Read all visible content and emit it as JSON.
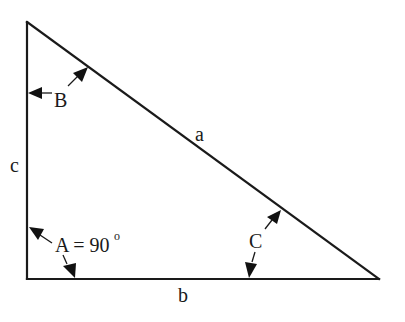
{
  "diagram": {
    "type": "right-triangle",
    "colors": {
      "stroke": "#1a1a1a",
      "background": "#ffffff"
    },
    "vertices": {
      "top": {
        "x": 26,
        "y": 22
      },
      "bottom_left": {
        "x": 27,
        "y": 279
      },
      "bottom_right": {
        "x": 379,
        "y": 279
      }
    },
    "sides": {
      "a": {
        "label": "a",
        "description": "hypotenuse"
      },
      "b": {
        "label": "b",
        "description": "base"
      },
      "c": {
        "label": "c",
        "description": "vertical leg"
      }
    },
    "angles": {
      "A": {
        "label": "A = 90",
        "superscript": "o"
      },
      "B": {
        "label": "B"
      },
      "C": {
        "label": "C"
      }
    }
  }
}
